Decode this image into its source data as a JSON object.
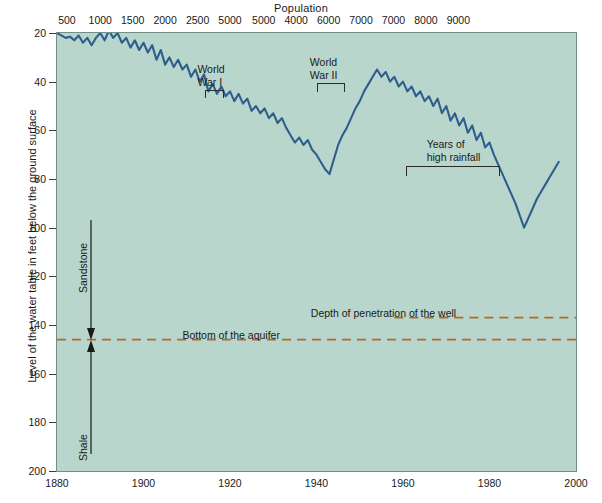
{
  "chart_data": {
    "type": "line",
    "title": "",
    "xlabel": "",
    "ylabel": "Level of the water table in feet below the ground surface",
    "top_axis_label": "Population",
    "xlim": [
      1880,
      2000
    ],
    "ylim": [
      20,
      200
    ],
    "y_inverted": true,
    "grid": false,
    "legend": "none",
    "bottom_ticks": [
      "1880",
      "1900",
      "1920",
      "1940",
      "1960",
      "1980",
      "2000"
    ],
    "bottom_tick_values": [
      1880,
      1900,
      1920,
      1940,
      1960,
      1980,
      2000
    ],
    "left_ticks": [
      "20",
      "40",
      "60",
      "80",
      "100",
      "120",
      "140",
      "160",
      "180",
      "200"
    ],
    "left_tick_values": [
      20,
      40,
      60,
      80,
      100,
      120,
      140,
      160,
      180,
      200
    ],
    "top_ticks": [
      "500",
      "1000",
      "1500",
      "2000",
      "2500",
      "5000",
      "5000",
      "4000",
      "6000",
      "7000",
      "7000",
      "8000",
      "9000"
    ],
    "top_tick_positions": [
      1882.3,
      1890.0,
      1897.5,
      1905.0,
      1912.5,
      1920.0,
      1927.8,
      1935.3,
      1942.8,
      1950.3,
      1957.8,
      1965.3,
      1972.8,
      1980.3,
      1987.8,
      1999.5
    ],
    "series": [
      {
        "name": "Water table level",
        "x": [
          1880,
          1881,
          1882,
          1883,
          1884,
          1885,
          1886,
          1887,
          1888,
          1889,
          1890,
          1891,
          1892,
          1893,
          1894,
          1895,
          1896,
          1897,
          1898,
          1899,
          1900,
          1901,
          1902,
          1903,
          1904,
          1905,
          1906,
          1907,
          1908,
          1909,
          1910,
          1911,
          1912,
          1913,
          1914,
          1915,
          1916,
          1917,
          1918,
          1919,
          1920,
          1921,
          1922,
          1923,
          1924,
          1925,
          1926,
          1927,
          1928,
          1929,
          1930,
          1931,
          1932,
          1933,
          1934,
          1935,
          1936,
          1937,
          1938,
          1939,
          1940,
          1941,
          1942,
          1943,
          1944,
          1945,
          1946,
          1947,
          1948,
          1949,
          1950,
          1951,
          1952,
          1953,
          1954,
          1955,
          1956,
          1957,
          1958,
          1959,
          1960,
          1961,
          1962,
          1963,
          1964,
          1965,
          1966,
          1967,
          1968,
          1969,
          1970,
          1971,
          1972,
          1973,
          1974,
          1975,
          1976,
          1977,
          1978,
          1979,
          1980,
          1981,
          1982,
          1983,
          1984,
          1985,
          1986,
          1987,
          1988,
          1989,
          1990,
          1991,
          1992,
          1993,
          1994,
          1995,
          1996
        ],
        "y": [
          20,
          21,
          22,
          21.5,
          23,
          21,
          24,
          22,
          25,
          22,
          20,
          23,
          19,
          22,
          20,
          24,
          22,
          26,
          23,
          27,
          24,
          28,
          25,
          31,
          27,
          33,
          30,
          34,
          31,
          35,
          33,
          38,
          35,
          40,
          37,
          44,
          41,
          45,
          42,
          46,
          44,
          48,
          45,
          49,
          47,
          52,
          50,
          53,
          51,
          55,
          53,
          57,
          55,
          59,
          62,
          65,
          63,
          66,
          64,
          68,
          70,
          73,
          76,
          78,
          72,
          66,
          62,
          59,
          55,
          51,
          48,
          44,
          41,
          38,
          35,
          38,
          36,
          40,
          38,
          42,
          40,
          44,
          42,
          46,
          44,
          48,
          46,
          50,
          47,
          53,
          50,
          56,
          53,
          58,
          55,
          61,
          58,
          64,
          61,
          67,
          65,
          70,
          74,
          78,
          82,
          86,
          90,
          95,
          100,
          96,
          92,
          88,
          85,
          82,
          79,
          76,
          73
        ],
        "color": "#2e5d8e"
      }
    ],
    "reference_lines": [
      {
        "name": "Depth of penetration of the well",
        "label": "Depth of penetration of the well",
        "y_value": 137,
        "style": "dashed",
        "color": "#b06a2b",
        "x_start": 1958,
        "x_end": 2000
      },
      {
        "name": "Bottom of the aquifer",
        "label": "Bottom of the aquifer",
        "y_value": 146,
        "style": "dashed",
        "color": "#b06a2b",
        "x_start": 1880,
        "x_end": 2000
      }
    ],
    "annotations": [
      {
        "name": "world-war-one",
        "text_line1": "World",
        "text_line2": "War I",
        "bracket_x_start": 1914,
        "bracket_x_end": 1918
      },
      {
        "name": "world-war-two",
        "text_line1": "World",
        "text_line2": "War II",
        "bracket_x_start": 1940,
        "bracket_x_end": 1946
      },
      {
        "name": "years-of-high-rainfall",
        "text_line1": "Years of",
        "text_line2": "high rainfall",
        "bracket_x_start": 1961,
        "bracket_x_end": 1982
      },
      {
        "name": "sandstone",
        "text": "Sandstone",
        "orientation": "vertical"
      },
      {
        "name": "shale",
        "text": "Shale",
        "orientation": "vertical"
      }
    ],
    "colors": {
      "plot_background": "#b9d6cd",
      "line": "#2e5d8e",
      "reference_line": "#b06a2b",
      "axis": "#3a3a3a",
      "text": "#1a1a1a"
    }
  },
  "labels": {
    "top_axis_title": "Population",
    "y_axis_title": "Level of the water table in feet below the ground surface",
    "ww1_line1": "World",
    "ww1_line2": "War I",
    "ww2_line1": "World",
    "ww2_line2": "War II",
    "rain_line1": "Years of",
    "rain_line2": "high rainfall",
    "well_depth": "Depth of penetration of the well",
    "aquifer_bottom": "Bottom of the aquifer",
    "sandstone": "Sandstone",
    "shale": "Shale"
  }
}
